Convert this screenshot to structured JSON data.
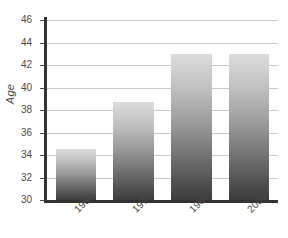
{
  "chart_data": {
    "type": "bar",
    "title": "",
    "xlabel": "",
    "ylabel": "Age",
    "categories": [
      "1960",
      "1970",
      "1980",
      "2003"
    ],
    "values": [
      34.5,
      38.7,
      43.0,
      43.0
    ],
    "ylim": [
      30,
      46
    ],
    "ytick_step": 2,
    "yticks": [
      30,
      32,
      34,
      36,
      38,
      40,
      42,
      44,
      46
    ],
    "ytick_labels": [
      "30",
      "32",
      "34",
      "36",
      "38",
      "40",
      "42",
      "44",
      "46"
    ],
    "grid": "horizontal",
    "legend": "none",
    "series": [
      {
        "name": "Age",
        "values": [
          34.5,
          38.7,
          43.0,
          43.0
        ]
      }
    ],
    "colors": {
      "bar_top": "#dcdcdc",
      "bar_bottom": "#3c3c3c",
      "gridline": "#c9c9c9",
      "axis": "#333333",
      "text": "#4a4a4a",
      "background": "#ffffff"
    }
  }
}
